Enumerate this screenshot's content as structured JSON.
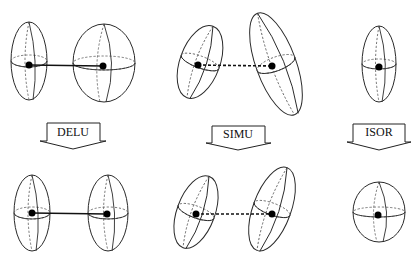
{
  "diagram": {
    "restraints": [
      {
        "label": "DELU",
        "bond_style": "solid",
        "before": "two ellipsoids with different shapes, solid bond",
        "after": "two ellipsoids with equal components along bond"
      },
      {
        "label": "SIMU",
        "bond_style": "dashed",
        "before": "two tilted ellipsoids of different size, dashed connection",
        "after": "two tilted ellipsoids of similar size"
      },
      {
        "label": "ISOR",
        "bond_style": "none",
        "before": "single elongated ellipsoid",
        "after": "single nearly spherical ellipsoid"
      }
    ],
    "colors": {
      "stroke": "#2a2a2a",
      "atom": "#000000",
      "background": "#ffffff"
    }
  }
}
